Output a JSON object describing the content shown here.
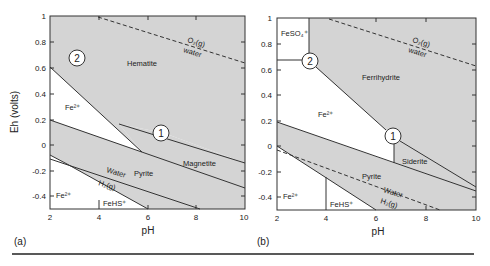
{
  "figure": {
    "y_axis_title": "Eh (volts)",
    "rule_color": "#222222",
    "shade_color": "#d4d4d4",
    "line_color": "#333333"
  },
  "panels": [
    {
      "tag": "(a)",
      "xlabel": "pH",
      "x_ticks": [
        "2",
        "4",
        "6",
        "8",
        "10"
      ],
      "y_ticks": [
        "1",
        "0.8",
        "0.6",
        "0.4",
        "0.2",
        "0",
        "-0.2",
        "-0.4"
      ],
      "regions": {
        "hematite": "Hematite",
        "fe2_upper": "Fe²⁺",
        "magnetite": "Magnetite",
        "pyrite": "Pyrite",
        "fe2_lower": "Fe²⁺",
        "fehs": "FeHS⁺"
      },
      "annotations": {
        "o2": "O₂(g)",
        "water_top": "water",
        "water_bottom": "Water",
        "h2": "H₂(g)",
        "circle1": "1",
        "circle2": "2"
      }
    },
    {
      "tag": "(b)",
      "xlabel": "pH",
      "x_ticks": [
        "2",
        "4",
        "6",
        "8",
        "10"
      ],
      "y_ticks": [
        "1",
        "0.8",
        "0.6",
        "0.4",
        "0.2",
        "0",
        "-0.2",
        "-0.4"
      ],
      "regions": {
        "feso4": "FeSO₄⁺",
        "ferrihydrite": "Ferrihydrite",
        "fe2_upper": "Fe²⁺",
        "siderite": "Siderite",
        "pyrite": "Pyrite",
        "fe2_lower": "Fe²⁺",
        "fehs": "FeHS⁺"
      },
      "annotations": {
        "o2": "O₂(g)",
        "water_top": "water",
        "water_bottom": "Water",
        "h2": "H₂(g)",
        "circle1": "1",
        "circle2": "2"
      }
    }
  ]
}
